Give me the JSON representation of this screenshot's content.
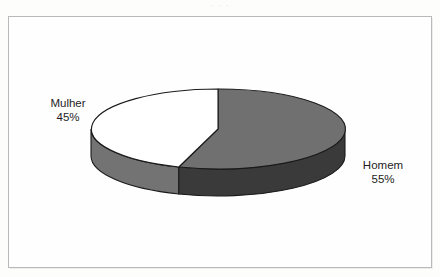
{
  "page": {
    "background_color": "#fdfdfc",
    "frame_border_color": "#b9b9b9",
    "scan_artifact_text": "· · ·"
  },
  "chart_data": {
    "type": "pie",
    "title": "",
    "subtitle": "",
    "xlabel": "",
    "ylabel": "",
    "three_d": true,
    "legend_position": "none",
    "labels_position": "outside",
    "categories": [
      "Homem",
      "Mulher"
    ],
    "values": [
      55,
      45
    ],
    "unit": "%",
    "slices": [
      {
        "name": "Homem",
        "value": 55,
        "value_label": "55%",
        "top_color": "#707070",
        "side_color": "#3a3a3a",
        "outline_color": "#1a1a1a"
      },
      {
        "name": "Mulher",
        "value": 45,
        "value_label": "45%",
        "top_color": "#ffffff",
        "side_color": "#737373",
        "outline_color": "#1a1a1a"
      }
    ],
    "annotations": [
      {
        "text": "Mulher",
        "value_text": "45%",
        "anchor": "left"
      },
      {
        "text": "Homem",
        "value_text": "55%",
        "anchor": "right"
      }
    ]
  },
  "geometry": {
    "center_x": 218,
    "center_y": 129,
    "radius_x": 127,
    "radius_y": 40,
    "depth": 27
  }
}
